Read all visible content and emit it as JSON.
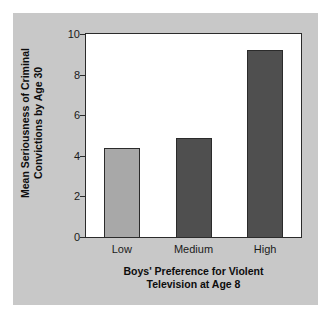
{
  "chart_data": {
    "type": "bar",
    "title": "",
    "subtitle": "",
    "xlabel_line1": "Boys' Preference for Violent",
    "xlabel_line2": "Television at Age 8",
    "ylabel_line1": "Mean Seriousness of Criminal",
    "ylabel_line2": "Convictions by Age 30",
    "categories": [
      "Low",
      "Medium",
      "High"
    ],
    "values": [
      4.4,
      4.9,
      9.2
    ],
    "ylim": [
      0,
      10
    ],
    "yticks": [
      0,
      2,
      4,
      6,
      8,
      10
    ],
    "ytick_labels": [
      "0",
      "2",
      "4",
      "6",
      "8",
      "10"
    ],
    "grid": false,
    "legend": "none",
    "bar_colors": [
      "#a8a8a8",
      "#4f4f4f",
      "#4f4f4f"
    ],
    "bar_edge_color": "#2b2b2b",
    "panel_color": "#c8c8c8",
    "plot_background": "#ffffff",
    "axis_color": "#2b2b2b",
    "text_color": "#0d0d0d"
  }
}
